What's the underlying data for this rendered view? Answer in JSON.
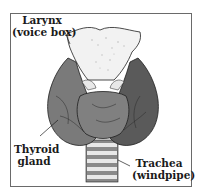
{
  "diagram": {
    "labels": {
      "larynx": {
        "line1": "Larynx",
        "line2": "(voice box)"
      },
      "thyroid": {
        "line1": "Thyroid",
        "line2": "gland"
      },
      "trachea": {
        "line1": "Trachea",
        "line2": "(windpipe)"
      }
    },
    "colors": {
      "gland_fill": "#7a7a7a",
      "gland_dark": "#3c3c3c",
      "larynx_fill": "#f2f2f2",
      "outline": "#1e1e1e",
      "frame": "#6a6a6a"
    }
  }
}
